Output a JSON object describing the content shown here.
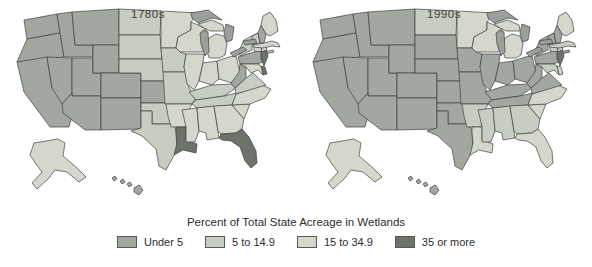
{
  "chart_data": {
    "type": "choropleth",
    "title": "Percent of Total State Acreage in Wetlands",
    "unit": "percent of total state acreage in wetlands",
    "classes": [
      {
        "key": "u5",
        "label": "Under 5",
        "color": "#a2a8a0"
      },
      {
        "key": "c5_15",
        "label": "5 to 14.9",
        "color": "#c8cdc2"
      },
      {
        "key": "c15_35",
        "label": "15 to 34.9",
        "color": "#d4d8cc"
      },
      {
        "key": "c35",
        "label": "35 or more",
        "color": "#6d736b"
      }
    ],
    "border_color": "#404040",
    "water_color": "#9ba19a",
    "maps": [
      {
        "title": "1780s",
        "state_classes": {
          "WA": "u5",
          "OR": "u5",
          "CA": "u5",
          "ID": "u5",
          "NV": "u5",
          "MT": "u5",
          "WY": "u5",
          "UT": "u5",
          "CO": "u5",
          "AZ": "u5",
          "NM": "u5",
          "KS": "u5",
          "PA": "u5",
          "WV": "u5",
          "NH": "u5",
          "HI": "u5",
          "ND": "c5_15",
          "SD": "c5_15",
          "NE": "c5_15",
          "OK": "c5_15",
          "TX": "c5_15",
          "IA": "c5_15",
          "MO": "c5_15",
          "KY": "c5_15",
          "TN": "c5_15",
          "VA": "c5_15",
          "NY": "c5_15",
          "VT": "c5_15",
          "MN": "c15_35",
          "WI": "c15_35",
          "MI": "c15_35",
          "IL": "c15_35",
          "IN": "c15_35",
          "OH": "c15_35",
          "AR": "c15_35",
          "MS": "c15_35",
          "AL": "c15_35",
          "GA": "c15_35",
          "SC": "c15_35",
          "NC": "c15_35",
          "MD": "c15_35",
          "ME": "c15_35",
          "MA": "c15_35",
          "CT": "c15_35",
          "RI": "c15_35",
          "AK": "c15_35",
          "LA": "c35",
          "FL": "c35",
          "NJ": "c35",
          "DE": "c35"
        }
      },
      {
        "title": "1990s",
        "state_classes": {
          "WA": "u5",
          "OR": "u5",
          "CA": "u5",
          "ID": "u5",
          "NV": "u5",
          "MT": "u5",
          "WY": "u5",
          "UT": "u5",
          "CO": "u5",
          "AZ": "u5",
          "NM": "u5",
          "SD": "u5",
          "NE": "u5",
          "KS": "u5",
          "OK": "u5",
          "TX": "u5",
          "IA": "u5",
          "MO": "u5",
          "IL": "u5",
          "IN": "u5",
          "OH": "u5",
          "KY": "u5",
          "TN": "u5",
          "WV": "u5",
          "VA": "u5",
          "PA": "u5",
          "NY": "u5",
          "VT": "u5",
          "NH": "u5",
          "HI": "u5",
          "ND": "c5_15",
          "MS": "c5_15",
          "AL": "c5_15",
          "GA": "c5_15",
          "AR": "c5_15",
          "MD": "c5_15",
          "MA": "c5_15",
          "CT": "c5_15",
          "RI": "c5_15",
          "MN": "c15_35",
          "WI": "c15_35",
          "MI": "c15_35",
          "ME": "c15_35",
          "LA": "c15_35",
          "FL": "c15_35",
          "SC": "c15_35",
          "NC": "c15_35",
          "DE": "c15_35",
          "AK": "c15_35",
          "NJ": "c35"
        }
      }
    ],
    "legend": {
      "title": "Percent of Total State Acreage in Wetlands",
      "position": "bottom-center"
    }
  }
}
